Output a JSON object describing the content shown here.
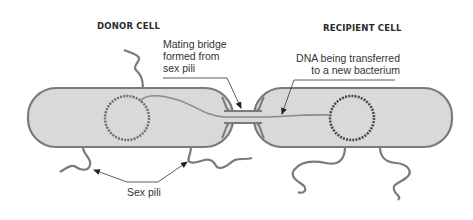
{
  "diagram": {
    "cells": {
      "donor": {
        "label": "DONOR CELL"
      },
      "recipient": {
        "label": "RECIPIENT CELL"
      }
    },
    "annotations": {
      "mating_bridge": {
        "line1": "Mating bridge",
        "line2": "formed from",
        "line3": "sex pili"
      },
      "dna_transfer": {
        "line1": "DNA being transferred",
        "line2": "to a new bacterium"
      },
      "sex_pili": {
        "label": "Sex pili"
      }
    },
    "colors": {
      "cell_fill": "#d9d9d9",
      "cell_stroke": "#7a7a7a",
      "plasmid": "#6e6e6e",
      "recipient_plasmid": "#4a4a4a",
      "dna_strand": "#8a8a8a",
      "leader_line": "#333333",
      "background": "#ffffff"
    }
  }
}
